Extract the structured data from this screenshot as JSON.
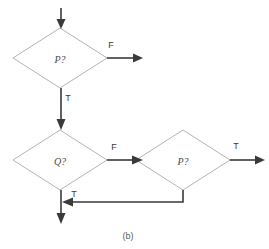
{
  "figure": {
    "caption": "(b)",
    "caption_x": 128,
    "caption_y": 236,
    "background": "#ffffff",
    "outline_color": "#b3b3b3",
    "connector_color": "#3a3a3a"
  },
  "nodes": [
    {
      "id": "decision-p-top",
      "label": "P?",
      "cx": 60,
      "cy": 58,
      "rx": 47,
      "ry": 30
    },
    {
      "id": "decision-q",
      "label": "Q?",
      "cx": 60,
      "cy": 160,
      "rx": 47,
      "ry": 30
    },
    {
      "id": "decision-p-right",
      "label": "P?",
      "cx": 183,
      "cy": 160,
      "rx": 47,
      "ry": 30
    }
  ],
  "edges": [
    {
      "id": "entry-arrow",
      "label": "",
      "from": "entry",
      "to": "decision-p-top"
    },
    {
      "id": "p-top-false",
      "label": "F",
      "label_x": 111,
      "label_y": 45,
      "from": "decision-p-top",
      "to": "exit-right"
    },
    {
      "id": "p-top-true",
      "label": "T",
      "label_x": 68,
      "label_y": 98,
      "from": "decision-p-top",
      "to": "decision-q"
    },
    {
      "id": "q-false",
      "label": "F",
      "label_x": 114,
      "label_y": 147,
      "from": "decision-q",
      "to": "decision-p-right"
    },
    {
      "id": "q-true",
      "label": "T",
      "label_x": 74,
      "label_y": 194,
      "from": "decision-q",
      "to": "exit-bottom"
    },
    {
      "id": "p-right-true",
      "label": "T",
      "label_x": 236,
      "label_y": 146,
      "from": "decision-p-right",
      "to": "exit-far-right"
    },
    {
      "id": "p-right-false-loop",
      "label": "",
      "from": "decision-p-right",
      "to": "exit-bottom"
    }
  ]
}
